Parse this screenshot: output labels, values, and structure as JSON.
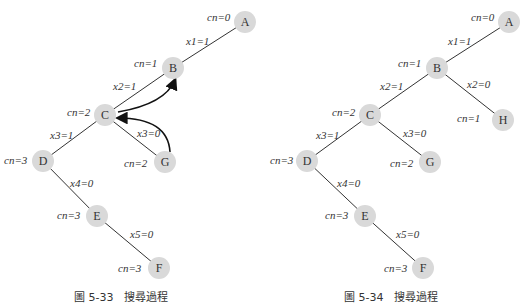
{
  "figures": [
    {
      "caption": "圖 5-33　搜尋過程",
      "nodes": [
        {
          "id": "A",
          "cn": "cn=0"
        },
        {
          "id": "B",
          "cn": "cn=1"
        },
        {
          "id": "C",
          "cn": "cn=2"
        },
        {
          "id": "D",
          "cn": "cn=3"
        },
        {
          "id": "E",
          "cn": "cn=3"
        },
        {
          "id": "F",
          "cn": "cn=3"
        },
        {
          "id": "G",
          "cn": "cn=2"
        }
      ],
      "edges": [
        {
          "from": "A",
          "to": "B",
          "label": "x1=1"
        },
        {
          "from": "B",
          "to": "C",
          "label": "x2=1"
        },
        {
          "from": "C",
          "to": "D",
          "label": "x3=1"
        },
        {
          "from": "C",
          "to": "G",
          "label": "x3=0"
        },
        {
          "from": "D",
          "to": "E",
          "label": "x4=0"
        },
        {
          "from": "E",
          "to": "F",
          "label": "x5=0"
        }
      ],
      "backtrack_arrows": [
        {
          "from": "G",
          "to": "C"
        },
        {
          "from": "C",
          "to": "B"
        }
      ]
    },
    {
      "caption": "圖 5-34　搜尋過程",
      "nodes": [
        {
          "id": "A",
          "cn": "cn=0"
        },
        {
          "id": "B",
          "cn": "cn=1"
        },
        {
          "id": "C",
          "cn": "cn=2"
        },
        {
          "id": "H",
          "cn": "cn=1"
        },
        {
          "id": "D",
          "cn": "cn=3"
        },
        {
          "id": "E",
          "cn": "cn=3"
        },
        {
          "id": "F",
          "cn": "cn=3"
        },
        {
          "id": "G",
          "cn": "cn=2"
        }
      ],
      "edges": [
        {
          "from": "A",
          "to": "B",
          "label": "x1=1"
        },
        {
          "from": "B",
          "to": "C",
          "label": "x2=1"
        },
        {
          "from": "B",
          "to": "H",
          "label": "x2=0"
        },
        {
          "from": "C",
          "to": "D",
          "label": "x3=1"
        },
        {
          "from": "C",
          "to": "G",
          "label": "x3=0"
        },
        {
          "from": "D",
          "to": "E",
          "label": "x4=0"
        },
        {
          "from": "E",
          "to": "F",
          "label": "x5=0"
        }
      ]
    }
  ]
}
